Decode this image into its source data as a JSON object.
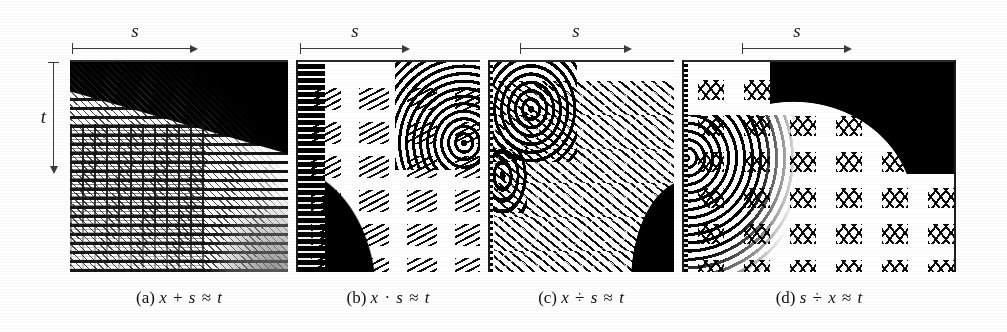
{
  "figure": {
    "kind": "four-panel raster figure",
    "background_color": "#ffffff",
    "ink_color": "#000000",
    "axis_color": "#3a3a3a"
  },
  "axes": {
    "horizontal_label": "s",
    "vertical_label": "t",
    "horizontal_arrow_direction": "right",
    "vertical_arrow_direction": "down"
  },
  "panels": [
    {
      "key": "a",
      "tag": "(a)",
      "caption_lhs_1": "x",
      "caption_op": "+",
      "caption_lhs_2": "s",
      "caption_rel": "≈",
      "caption_rhs": "t",
      "caption_full": "(a) x + s ≈ t",
      "s_label": "s",
      "show_t_axis": true,
      "t_label": "t"
    },
    {
      "key": "b",
      "tag": "(b)",
      "caption_lhs_1": "x",
      "caption_op": "·",
      "caption_lhs_2": "s",
      "caption_rel": "≈",
      "caption_rhs": "t",
      "caption_full": "(b) x · s ≈ t",
      "s_label": "s",
      "show_t_axis": false,
      "t_label": ""
    },
    {
      "key": "c",
      "tag": "(c)",
      "caption_lhs_1": "x",
      "caption_op": "÷",
      "caption_lhs_2": "s",
      "caption_rel": "≈",
      "caption_rhs": "t",
      "caption_full": "(c) x ÷ s ≈ t",
      "s_label": "s",
      "show_t_axis": false,
      "t_label": ""
    },
    {
      "key": "d",
      "tag": "(d)",
      "caption_lhs_1": "s",
      "caption_op": "÷",
      "caption_lhs_2": "x",
      "caption_rel": "≈",
      "caption_rhs": "t",
      "caption_full": "(d) s ÷ x ≈ t",
      "s_label": "s",
      "show_t_axis": false,
      "t_label": ""
    }
  ]
}
